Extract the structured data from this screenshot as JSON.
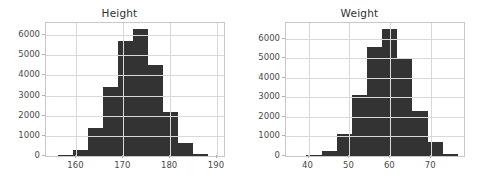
{
  "figure": {
    "background_color": "#ffffff",
    "bar_color": "#333333",
    "grid_color": "#d9d9d9",
    "axis_color": "#c8c8c8",
    "tick_label_color": "#4a4a4a",
    "title_color": "#303030"
  },
  "chart_data": [
    {
      "type": "bar",
      "title": "Height",
      "xlabel": "",
      "ylabel": "",
      "grid": true,
      "legend": "none",
      "xlim": [
        153.5,
        191.5
      ],
      "ylim": [
        0,
        6600
      ],
      "xticks": [
        160,
        170,
        180,
        190
      ],
      "xtick_labels": [
        "160",
        "170",
        "180",
        "190"
      ],
      "yticks": [
        0,
        1000,
        2000,
        3000,
        4000,
        5000,
        6000
      ],
      "ytick_labels": [
        "0",
        "1000",
        "2000",
        "3000",
        "4000",
        "5000",
        "6000"
      ],
      "bin_edges": [
        156.0,
        159.2,
        162.4,
        165.6,
        168.8,
        172.0,
        175.2,
        178.4,
        181.6,
        184.8,
        188.0
      ],
      "bin_centers": [
        157.6,
        160.8,
        164.0,
        167.2,
        170.4,
        173.6,
        176.8,
        180.0,
        183.2,
        186.4
      ],
      "values": [
        60,
        280,
        1380,
        3420,
        5700,
        6300,
        4500,
        2200,
        650,
        110
      ]
    },
    {
      "type": "bar",
      "title": "Weight",
      "xlabel": "",
      "ylabel": "",
      "grid": true,
      "legend": "none",
      "xlim": [
        34.5,
        78.0
      ],
      "ylim": [
        0,
        6800
      ],
      "xticks": [
        40,
        50,
        60,
        70
      ],
      "xtick_labels": [
        "40",
        "50",
        "60",
        "70"
      ],
      "yticks": [
        0,
        1000,
        2000,
        3000,
        4000,
        5000,
        6000
      ],
      "ytick_labels": [
        "0",
        "1000",
        "2000",
        "3000",
        "4000",
        "5000",
        "6000"
      ],
      "bin_edges": [
        39.5,
        43.2,
        46.9,
        50.6,
        54.3,
        58.0,
        61.7,
        65.4,
        69.1,
        72.8,
        76.5
      ],
      "bin_centers": [
        41.35,
        45.05,
        48.75,
        52.45,
        56.15,
        59.85,
        63.55,
        67.25,
        70.95,
        74.65
      ],
      "values": [
        60,
        250,
        1120,
        3100,
        5550,
        6500,
        4950,
        2300,
        720,
        110
      ]
    }
  ]
}
